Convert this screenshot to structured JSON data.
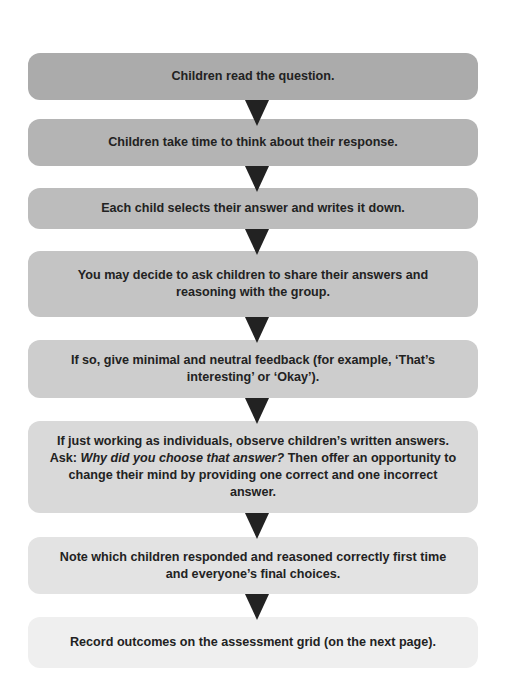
{
  "flowchart": {
    "steps": [
      {
        "text": "Children read the question.",
        "color": "#ababab"
      },
      {
        "text": "Children take time to think about their response.",
        "color": "#b4b4b4"
      },
      {
        "text": "Each child selects their answer and writes it down.",
        "color": "#bcbcbc"
      },
      {
        "text": "You may decide to ask children to share their answers and reasoning with the group.",
        "color": "#c4c4c4"
      },
      {
        "text": "If so, give minimal and neutral feedback (for example, ‘That’s interesting’ or ‘Okay’).",
        "color": "#cdcdcd"
      },
      {
        "text_before": "If just working as individuals, observe children’s written answers. Ask: ",
        "text_italic": "Why did you choose that answer?",
        "text_after": " Then offer an opportunity to change their mind by providing one correct and one incorrect answer.",
        "color": "#d9d9d9"
      },
      {
        "text": "Note which children responded and reasoned correctly first time and everyone’s final choices.",
        "color": "#e3e3e3"
      },
      {
        "text": "Record outcomes on the assessment grid (on the next page).",
        "color": "#efefef"
      }
    ],
    "arrow_color": "#222222",
    "arrow_icon": "down-triangle-arrow"
  }
}
